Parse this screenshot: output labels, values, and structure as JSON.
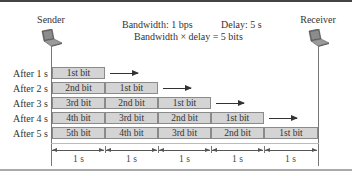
{
  "header": {
    "sender_label": "Sender",
    "receiver_label": "Receiver",
    "bandwidth": "Bandwidth: 1 bps",
    "delay": "Delay: 5 s",
    "product": "Bandwidth × delay = 5 bits"
  },
  "icons": {
    "sender": "laptop-icon",
    "receiver": "laptop-icon"
  },
  "rows": [
    {
      "label": "After 1 s",
      "cells": [
        "1st bit"
      ]
    },
    {
      "label": "After 2 s",
      "cells": [
        "2nd bit",
        "1st bit"
      ]
    },
    {
      "label": "After 3 s",
      "cells": [
        "3rd bit",
        "2nd bit",
        "1st bit"
      ]
    },
    {
      "label": "After 4 s",
      "cells": [
        "4th bit",
        "3rd bit",
        "2nd bit",
        "1st bit"
      ]
    },
    {
      "label": "After 5 s",
      "cells": [
        "5th bit",
        "4th bit",
        "3rd bit",
        "2nd bit",
        "1st bit"
      ]
    }
  ],
  "timeline": [
    "1 s",
    "1 s",
    "1 s",
    "1 s",
    "1 s"
  ],
  "colors": {
    "cell_fill": "#d4d4d4",
    "cell_border": "#8a8a8a",
    "arrow": "#333333"
  }
}
